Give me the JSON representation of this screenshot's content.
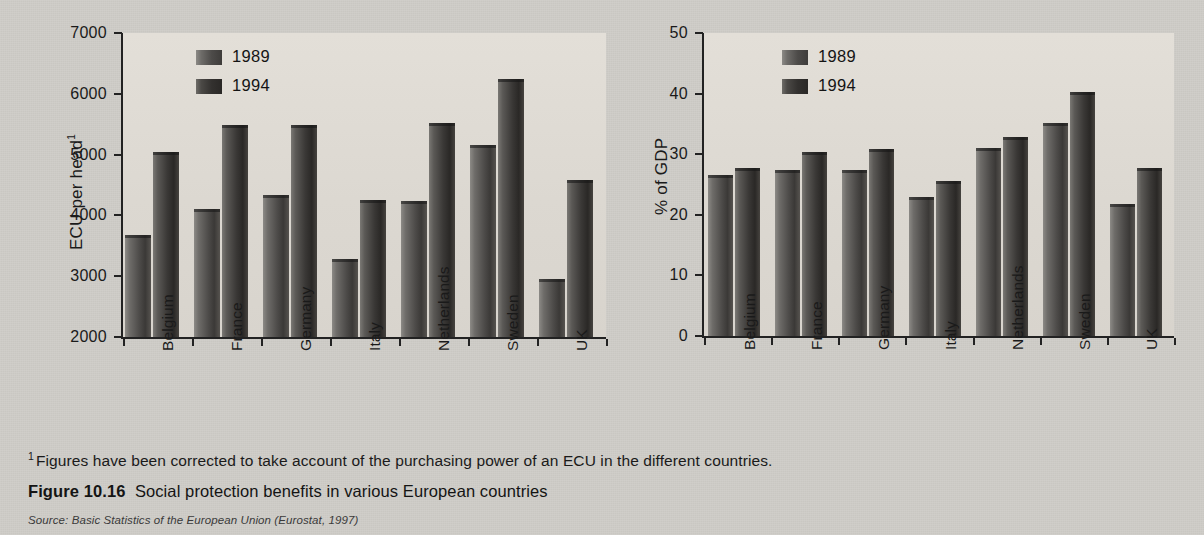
{
  "figure": {
    "footnote_marker": "1",
    "footnote_text": "Figures have been corrected to take account of the purchasing power of an ECU in the different countries.",
    "caption_label": "Figure 10.16",
    "caption_text": "Social protection benefits in various European countries",
    "source_label": "Source:",
    "source_text": "Basic Statistics of the European Union (Eurostat, 1997)"
  },
  "colors": {
    "page_background": "#cfcdc8",
    "plot_background": "#ddd9d2",
    "series_1989": "#4d4b49",
    "series_1994": "#33312f",
    "axis": "#222222",
    "text": "#1a1a1a"
  },
  "chart_data": [
    {
      "id": "ecu-per-head",
      "type": "bar",
      "title": "",
      "xlabel": "",
      "ylabel": "ECU per head",
      "ylabel_superscript": "1",
      "ylim": [
        2000,
        7000
      ],
      "yticks": [
        2000,
        3000,
        4000,
        5000,
        6000,
        7000
      ],
      "ytick_labels": [
        "2000",
        "3000",
        "4000",
        "5000",
        "6000",
        "7000"
      ],
      "grid": false,
      "legend_position": "top-left-inside",
      "categories": [
        "Belgium",
        "France",
        "Germany",
        "Italy",
        "Netherlands",
        "Sweden",
        "UK"
      ],
      "series": [
        {
          "name": "1989",
          "values": [
            3670,
            4110,
            4340,
            3290,
            4230,
            5150,
            2950
          ]
        },
        {
          "name": "1994",
          "values": [
            5050,
            5480,
            5490,
            4260,
            5520,
            6250,
            4580
          ]
        }
      ]
    },
    {
      "id": "percent-of-gdp",
      "type": "bar",
      "title": "",
      "xlabel": "",
      "ylabel": "% of GDP",
      "ylabel_superscript": "",
      "ylim": [
        0,
        50
      ],
      "yticks": [
        0,
        10,
        20,
        30,
        40,
        50
      ],
      "ytick_labels": [
        "0",
        "10",
        "20",
        "30",
        "40",
        "50"
      ],
      "grid": false,
      "legend_position": "top-left-inside",
      "categories": [
        "Belgium",
        "France",
        "Germany",
        "Italy",
        "Netherlands",
        "Sweden",
        "UK"
      ],
      "series": [
        {
          "name": "1989",
          "values": [
            26.6,
            27.4,
            27.4,
            23.0,
            31.0,
            35.2,
            21.7
          ]
        },
        {
          "name": "1994",
          "values": [
            27.7,
            30.4,
            30.8,
            25.5,
            32.9,
            40.2,
            27.8
          ]
        }
      ]
    }
  ]
}
